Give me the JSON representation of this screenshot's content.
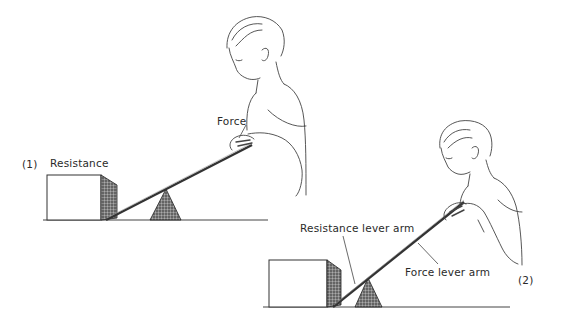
{
  "figure": {
    "panel1": {
      "number": "(1)",
      "labels": {
        "resistance": "Resistance",
        "force": "Force"
      }
    },
    "panel2": {
      "number": "(2)",
      "labels": {
        "resistance_lever_arm": "Resistance lever arm",
        "force_lever_arm": "Force lever arm"
      }
    },
    "colors": {
      "ink": "#2a2a2a",
      "shade": "#555555",
      "background": "#ffffff"
    }
  }
}
